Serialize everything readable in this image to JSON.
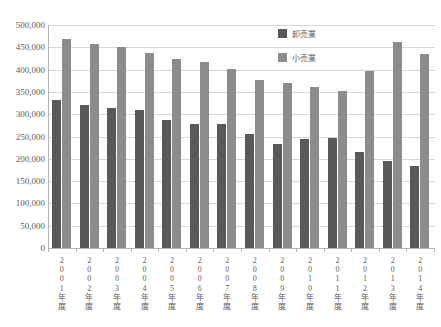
{
  "title_strip": "",
  "legend": {
    "position": "inside-top-right",
    "entries": [
      {
        "name": "wholesale-legend",
        "label": "卸売業",
        "color": "#595959"
      },
      {
        "name": "retail-legend",
        "label": "小売業",
        "color": "#8c8c8c"
      }
    ]
  },
  "axis": {
    "y_ticks": [
      "500,000",
      "450,000",
      "400,000",
      "350,000",
      "300,000",
      "250,000",
      "200,000",
      "150,000",
      "100,000",
      "50,000",
      "0"
    ],
    "x_labels": [
      "2001年度",
      "2002年度",
      "2003年度",
      "2004年度",
      "2005年度",
      "2006年度",
      "2007年度",
      "2008年度",
      "2009年度",
      "2010年度",
      "2011年度",
      "2012年度",
      "2013年度",
      "2014年度"
    ]
  },
  "chart_data": {
    "type": "bar",
    "title": "",
    "xlabel": "",
    "ylabel": "",
    "ylim": [
      0,
      500000
    ],
    "ytick_step": 50000,
    "grid": true,
    "legend_position": "inside-top-right",
    "categories": [
      "2001年度",
      "2002年度",
      "2003年度",
      "2004年度",
      "2005年度",
      "2006年度",
      "2007年度",
      "2008年度",
      "2009年度",
      "2010年度",
      "2011年度",
      "2012年度",
      "2013年度",
      "2014年度"
    ],
    "series": [
      {
        "name": "卸売業",
        "color": "#595959",
        "values": [
          331000,
          321000,
          313000,
          309000,
          288000,
          278000,
          278000,
          256000,
          234000,
          245000,
          246000,
          216000,
          196000,
          185000
        ]
      },
      {
        "name": "小売業",
        "color": "#8c8c8c",
        "values": [
          469000,
          457000,
          450000,
          438000,
          424000,
          417000,
          401000,
          376000,
          369000,
          362000,
          352000,
          398000,
          462000,
          436000
        ]
      }
    ]
  }
}
